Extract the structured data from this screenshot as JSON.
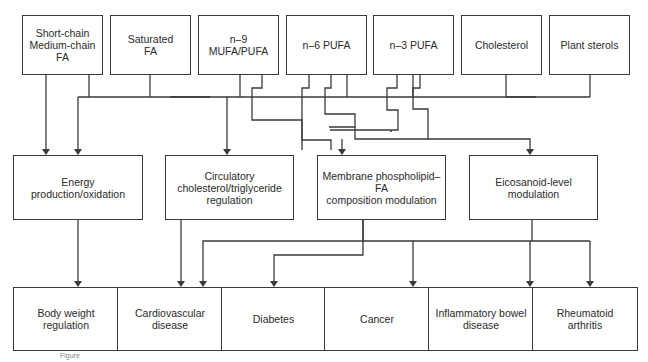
{
  "diagram": {
    "sources": [
      {
        "id": "scmc",
        "label": "Short-chain\nMedium-chain\nFA"
      },
      {
        "id": "sfa",
        "label": "Saturated\nFA"
      },
      {
        "id": "n9",
        "label": "n–9\nMUFA/PUFA"
      },
      {
        "id": "n6",
        "label": "n–6 PUFA"
      },
      {
        "id": "n3",
        "label": "n–3 PUFA"
      },
      {
        "id": "chol",
        "label": "Cholesterol"
      },
      {
        "id": "plant",
        "label": "Plant sterols"
      }
    ],
    "mechanisms": [
      {
        "id": "energy",
        "label": "Energy\nproduction/oxidation"
      },
      {
        "id": "circ",
        "label": "Circulatory\ncholesterol/triglyceride\nregulation"
      },
      {
        "id": "membrane",
        "label": "Membrane phospholipid–FA\ncomposition modulation"
      },
      {
        "id": "eico",
        "label": "Eicosanoid-level\nmodulation"
      }
    ],
    "outcomes": [
      {
        "id": "bw",
        "label": "Body weight\nregulation"
      },
      {
        "id": "cvd",
        "label": "Cardiovascular\ndisease"
      },
      {
        "id": "diab",
        "label": "Diabetes"
      },
      {
        "id": "cancer",
        "label": "Cancer"
      },
      {
        "id": "ibd",
        "label": "Inflammatory bowel\ndisease"
      },
      {
        "id": "ra",
        "label": "Rheumatoid\narthritis"
      }
    ],
    "edges": [
      [
        "scmc",
        "energy"
      ],
      [
        "sfa",
        "energy"
      ],
      [
        "sfa",
        "circ"
      ],
      [
        "n9",
        "circ"
      ],
      [
        "n6",
        "circ"
      ],
      [
        "n3",
        "circ"
      ],
      [
        "chol",
        "circ"
      ],
      [
        "plant",
        "circ"
      ],
      [
        "n9",
        "membrane"
      ],
      [
        "n6",
        "membrane"
      ],
      [
        "n3",
        "membrane"
      ],
      [
        "n6",
        "eico"
      ],
      [
        "n3",
        "eico"
      ],
      [
        "energy",
        "bw"
      ],
      [
        "circ",
        "cvd"
      ],
      [
        "membrane",
        "cvd"
      ],
      [
        "membrane",
        "diab"
      ],
      [
        "membrane",
        "cancer"
      ],
      [
        "eico",
        "cancer"
      ],
      [
        "eico",
        "ibd"
      ],
      [
        "eico",
        "ra"
      ]
    ],
    "caption": "Figure"
  }
}
